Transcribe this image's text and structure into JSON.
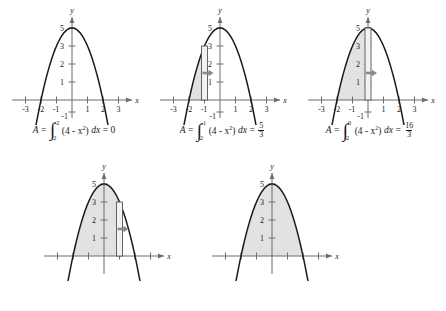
{
  "figure": {
    "curve_expression": "4 - x^2",
    "shading_color": "#e2e2e2",
    "curve_color": "#1a1a1a",
    "axis_color": "#6d6d6d",
    "arrow_color": "#8a8a8a",
    "axis": {
      "x_label": "x",
      "y_label": "y",
      "x_ticks": [
        "-3",
        "-2",
        "-1",
        "1",
        "2",
        "3"
      ],
      "x_tick_values": [
        -3,
        -2,
        -1,
        1,
        2,
        3
      ],
      "y_ticks": [
        "5",
        "3",
        "2",
        "1",
        "-1"
      ],
      "y_tick_values": [
        5,
        3,
        2,
        1,
        -1
      ],
      "xlim": [
        -3.6,
        3.6
      ],
      "ylim": [
        -1.4,
        5.9
      ]
    },
    "panels": [
      {
        "id": "panel-1",
        "shade_from": -2,
        "shade_to": -2,
        "sweep_line_x": null,
        "show_arrow": false,
        "show_axis_labels": true,
        "caption": {
          "area_symbol": "A",
          "equals": "=",
          "lower_limit": "-2",
          "upper_limit": "-2",
          "integrand": "(4 - x",
          "exponent": "2",
          "integrand_close": ")",
          "differential": "dx",
          "result_equals": "=",
          "result": "0",
          "result_is_fraction": false
        }
      },
      {
        "id": "panel-2",
        "shade_from": -2,
        "shade_to": -1,
        "sweep_line_x": -1,
        "show_arrow": true,
        "show_axis_labels": true,
        "caption": {
          "area_symbol": "A",
          "equals": "=",
          "lower_limit": "-2",
          "upper_limit": "-1",
          "integrand": "(4 - x",
          "exponent": "2",
          "integrand_close": ")",
          "differential": "dx",
          "result_equals": "=",
          "result_is_fraction": true,
          "result_numerator": "5",
          "result_denominator": "3"
        }
      },
      {
        "id": "panel-3",
        "shade_from": -2,
        "shade_to": 0,
        "sweep_line_x": 0,
        "show_arrow": true,
        "show_axis_labels": true,
        "caption": {
          "area_symbol": "A",
          "equals": "=",
          "lower_limit": "-2",
          "upper_limit": "0",
          "integrand": "(4 - x",
          "exponent": "2",
          "integrand_close": ")",
          "differential": "dx",
          "result_equals": "=",
          "result_is_fraction": true,
          "result_numerator": "16",
          "result_denominator": "3"
        }
      },
      {
        "id": "panel-4",
        "shade_from": -2,
        "shade_to": 1,
        "sweep_line_x": 1,
        "show_arrow": true,
        "show_axis_labels": true,
        "caption": null
      },
      {
        "id": "panel-5",
        "shade_from": -2,
        "shade_to": 2,
        "sweep_line_x": null,
        "show_arrow": false,
        "show_axis_labels": true,
        "caption": null
      }
    ]
  },
  "chart_data": {
    "type": "area",
    "title": "",
    "subtitle": "",
    "xlabel": "x",
    "ylabel": "y",
    "function": "f(x) = 4 - x^2",
    "xlim": [
      -3.6,
      3.6
    ],
    "ylim": [
      -1.4,
      5.9
    ],
    "xticks": [
      -3,
      -2,
      -1,
      1,
      2,
      3
    ],
    "yticks": [
      1,
      2,
      3,
      5,
      -1
    ],
    "grid": false,
    "legend": null,
    "roots": [
      -2,
      2
    ],
    "vertex": [
      0,
      4
    ],
    "series": [
      {
        "name": "f(x) = 4 - x^2",
        "x": [
          -2.4,
          -2.2,
          -2,
          -1.8,
          -1.6,
          -1.4,
          -1.2,
          -1,
          -0.8,
          -0.6,
          -0.4,
          -0.2,
          0,
          0.2,
          0.4,
          0.6,
          0.8,
          1,
          1.2,
          1.4,
          1.6,
          1.8,
          2,
          2.2,
          2.4
        ],
        "y": [
          -1.76,
          -0.84,
          0,
          0.76,
          1.44,
          2.04,
          2.56,
          3,
          3.36,
          3.64,
          3.84,
          3.96,
          4,
          3.96,
          3.84,
          3.64,
          3.36,
          3,
          2.56,
          2.04,
          1.44,
          0.76,
          0,
          -0.84,
          -1.76
        ]
      }
    ],
    "panels": [
      {
        "shade_interval": [
          -2,
          -2
        ],
        "area": 0,
        "area_label": "0"
      },
      {
        "shade_interval": [
          -2,
          -1
        ],
        "area": 1.6667,
        "area_label": "5/3"
      },
      {
        "shade_interval": [
          -2,
          0
        ],
        "area": 5.3333,
        "area_label": "16/3"
      },
      {
        "shade_interval": [
          -2,
          1
        ],
        "area": 9,
        "area_label": ""
      },
      {
        "shade_interval": [
          -2,
          2
        ],
        "area": 10.6667,
        "area_label": ""
      }
    ]
  }
}
